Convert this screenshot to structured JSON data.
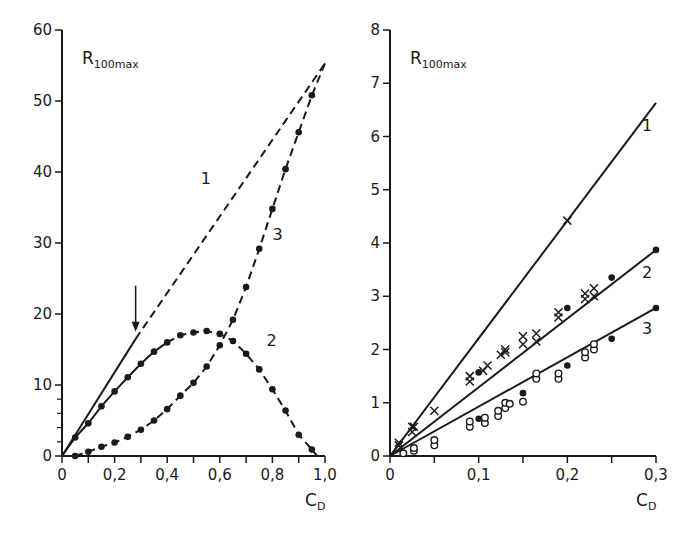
{
  "colors": {
    "ink": "#1a1a1a",
    "background": "#ffffff"
  },
  "chart_data": [
    {
      "type": "line",
      "panel": "left",
      "title": "",
      "ylabel": "R100max",
      "ylabel_main": "R",
      "ylabel_sub": "100max",
      "xlabel": "CD",
      "xlabel_main": "C",
      "xlabel_sub": "D",
      "xlim": [
        0,
        1.0
      ],
      "ylim": [
        0,
        60
      ],
      "xticks": [
        "0",
        "0,2",
        "0,4",
        "0,6",
        "0,8",
        "1,0"
      ],
      "xtick_values": [
        0,
        0.2,
        0.4,
        0.6,
        0.8,
        1.0
      ],
      "yticks": [
        "0",
        "10",
        "20",
        "30",
        "40",
        "50",
        "60"
      ],
      "ytick_values": [
        0,
        10,
        20,
        30,
        40,
        50,
        60
      ],
      "grid": false,
      "annotations": [
        {
          "type": "arrow",
          "x": 0.28,
          "y_from": 24,
          "y_to": 17.5,
          "direction": "down"
        }
      ],
      "series": [
        {
          "name": "1",
          "style": "solid to C_D≈0.28, then dashed",
          "markers": "none",
          "x": [
            0,
            0.28,
            1.0
          ],
          "y": [
            0,
            16.5,
            55.3
          ]
        },
        {
          "name": "2",
          "style": "solid/dashed with filled dots",
          "markers": "filled-circle",
          "x": [
            0,
            0.05,
            0.1,
            0.15,
            0.2,
            0.25,
            0.3,
            0.35,
            0.4,
            0.45,
            0.5,
            0.55,
            0.6,
            0.65,
            0.7,
            0.75,
            0.8,
            0.85,
            0.9,
            0.95,
            0.97
          ],
          "y": [
            0,
            2.6,
            4.6,
            7.0,
            9.1,
            11.1,
            13.0,
            14.7,
            16.0,
            17.0,
            17.4,
            17.6,
            17.2,
            16.2,
            14.4,
            12.2,
            9.4,
            6.4,
            3.0,
            0.9,
            0
          ]
        },
        {
          "name": "3",
          "style": "dashed with filled dots",
          "markers": "filled-circle",
          "x": [
            0,
            0.05,
            0.1,
            0.15,
            0.2,
            0.25,
            0.3,
            0.35,
            0.4,
            0.45,
            0.5,
            0.55,
            0.6,
            0.65,
            0.7,
            0.75,
            0.8,
            0.85,
            0.9,
            0.95,
            1.0
          ],
          "y": [
            0,
            0,
            0.6,
            1.3,
            1.9,
            2.7,
            3.7,
            5.0,
            6.6,
            8.5,
            10.3,
            12.6,
            15.6,
            19.2,
            23.8,
            29.2,
            34.8,
            40.4,
            45.6,
            50.8,
            55.3
          ]
        }
      ]
    },
    {
      "type": "line",
      "panel": "right",
      "title": "",
      "ylabel": "R100max",
      "ylabel_main": "R",
      "ylabel_sub": "100max",
      "xlabel": "CD",
      "xlabel_main": "C",
      "xlabel_sub": "D",
      "xlim": [
        0,
        0.3
      ],
      "ylim": [
        0,
        8
      ],
      "xticks": [
        "0",
        "0,1",
        "0,2",
        "0,3"
      ],
      "xtick_values": [
        0,
        0.1,
        0.2,
        0.3
      ],
      "yticks": [
        "0",
        "1",
        "2",
        "3",
        "4",
        "5",
        "6",
        "7",
        "8"
      ],
      "ytick_values": [
        0,
        1,
        2,
        3,
        4,
        5,
        6,
        7,
        8
      ],
      "grid": false,
      "series": [
        {
          "name": "1",
          "style": "solid",
          "markers": "cross (few)",
          "x": [
            0,
            0.3
          ],
          "y": [
            0,
            6.63
          ],
          "points": {
            "x": [
              0.01,
              0.025,
              0.05,
              0.2
            ],
            "y": [
              0.25,
              0.55,
              0.85,
              4.42
            ]
          }
        },
        {
          "name": "2",
          "style": "solid",
          "markers": "cross + filled-circle",
          "x": [
            0,
            0.3
          ],
          "y": [
            0,
            3.87
          ],
          "points": {
            "x": [
              0.01,
              0.025,
              0.027,
              0.09,
              0.09,
              0.1,
              0.105,
              0.11,
              0.125,
              0.13,
              0.13,
              0.15,
              0.15,
              0.165,
              0.165,
              0.19,
              0.19,
              0.2,
              0.22,
              0.22,
              0.23,
              0.23,
              0.25,
              0.3
            ],
            "y": [
              0.2,
              0.45,
              0.55,
              1.4,
              1.5,
              1.57,
              1.6,
              1.7,
              1.9,
              1.95,
              2.0,
              2.1,
              2.25,
              2.15,
              2.3,
              2.6,
              2.7,
              2.78,
              2.95,
              3.05,
              3.0,
              3.15,
              3.35,
              3.87
            ]
          }
        },
        {
          "name": "3",
          "style": "solid",
          "markers": "open-circle + filled-circle",
          "x": [
            0,
            0.3
          ],
          "y": [
            0,
            2.78
          ],
          "points": {
            "x": [
              0.015,
              0.027,
              0.027,
              0.05,
              0.05,
              0.09,
              0.09,
              0.1,
              0.107,
              0.107,
              0.122,
              0.122,
              0.13,
              0.13,
              0.135,
              0.15,
              0.15,
              0.165,
              0.165,
              0.19,
              0.19,
              0.2,
              0.22,
              0.22,
              0.23,
              0.23,
              0.25,
              0.3
            ],
            "y": [
              0.05,
              0.1,
              0.15,
              0.2,
              0.3,
              0.55,
              0.65,
              0.7,
              0.62,
              0.72,
              0.75,
              0.85,
              0.9,
              1.0,
              0.98,
              1.02,
              1.18,
              1.45,
              1.55,
              1.45,
              1.55,
              1.7,
              1.85,
              1.95,
              2.0,
              2.1,
              2.2,
              2.78
            ]
          }
        }
      ]
    }
  ]
}
